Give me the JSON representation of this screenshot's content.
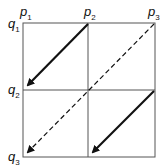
{
  "diagram": {
    "title": "",
    "column_labels": [
      {
        "letter": "p",
        "index": "1"
      },
      {
        "letter": "p",
        "index": "2"
      },
      {
        "letter": "p",
        "index": "3"
      }
    ],
    "row_labels": [
      {
        "letter": "q",
        "index": "1"
      },
      {
        "letter": "q",
        "index": "2"
      },
      {
        "letter": "q",
        "index": "3"
      }
    ],
    "grid": {
      "rows": 2,
      "cols": 2,
      "line_color": "#555555"
    },
    "arrows": [
      {
        "from": "p2,q1",
        "to": "p1,q2",
        "style": "solid"
      },
      {
        "from": "p3,q1",
        "to": "p1,q3",
        "style": "dashed"
      },
      {
        "from": "p3,q2",
        "to": "p2,q3",
        "style": "solid"
      }
    ]
  }
}
